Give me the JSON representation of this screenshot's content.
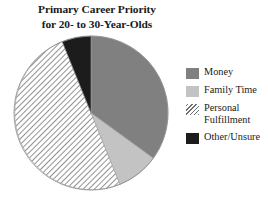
{
  "chart_data": {
    "type": "pie",
    "title": "Primary Career Priority for 20- to 30-Year-Olds",
    "title_lines": [
      "Primary Career Priority",
      "for 20- to 30-Year-Olds"
    ],
    "categories": [
      "Money",
      "Family Time",
      "Personal Fulfillment",
      "Other/Unsure"
    ],
    "values": [
      35,
      9,
      50,
      6
    ],
    "unit": "percent",
    "start_angle_deg": 0,
    "direction": "clockwise",
    "legend_position": "right",
    "grid": false,
    "xlabel": "",
    "ylabel": "",
    "slices": [
      {
        "label": "Money",
        "value": 35,
        "start_deg": 0,
        "end_deg": 126,
        "fill": "#808080",
        "pattern": "solid",
        "swatch_class": "sw-money"
      },
      {
        "label": "Family Time",
        "value": 9,
        "start_deg": 126,
        "end_deg": 158,
        "fill": "#c3c3c3",
        "pattern": "solid",
        "swatch_class": "sw-family"
      },
      {
        "label": "Personal Fulfillment",
        "value": 50,
        "start_deg": 158,
        "end_deg": 338,
        "fill": "#ffffff",
        "pattern": "diagonal-hatch",
        "swatch_class": "sw-personal"
      },
      {
        "label": "Other/Unsure",
        "value": 6,
        "start_deg": 338,
        "end_deg": 360,
        "fill": "#1c1c1c",
        "pattern": "solid",
        "swatch_class": "sw-other"
      }
    ],
    "geometry": {
      "center_x": 91,
      "center_y": 113,
      "radius": 77
    },
    "colors": {
      "money": "#808080",
      "family_time": "#c3c3c3",
      "personal_fulfillment_hatch": "#6e6e6e",
      "other_unsure": "#1c1c1c",
      "background": "#ffffff",
      "text": "#1a1a1a"
    }
  },
  "legend": {
    "entries": [
      {
        "label": "Money"
      },
      {
        "label": "Family Time"
      },
      {
        "label": "Personal\nFulfillment"
      },
      {
        "label": "Other/Unsure"
      }
    ]
  }
}
